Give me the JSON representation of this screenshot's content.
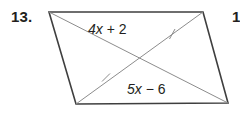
{
  "page": {
    "background_color": "#ffffff",
    "width": 240,
    "height": 126
  },
  "problem": {
    "number_label": "13.",
    "next_number_label": "1"
  },
  "figure": {
    "shape_name": "parallelogram",
    "outline_color": "#3f3f3f",
    "diagonal_color": "#8c8c8c",
    "text_color": "#231f20",
    "vertices": {
      "top_left": [
        49,
        12
      ],
      "top_right": [
        203,
        12
      ],
      "bottom_right": [
        228,
        103
      ],
      "bottom_left": [
        76,
        104
      ]
    },
    "diagonal_intersection": [
      139,
      58
    ],
    "tick_marks": [
      {
        "name": "tick-upper-right",
        "position": [
          172,
          34
        ]
      },
      {
        "name": "tick-lower-left",
        "position": [
          106,
          78
        ]
      }
    ]
  },
  "labels": {
    "top_diagonal": {
      "full_text": "4x + 2",
      "coefficient": "4",
      "variable": "x",
      "operator": "+",
      "constant": "2"
    },
    "bottom_diagonal": {
      "full_text": "5x − 6",
      "coefficient": "5",
      "variable": "x",
      "operator": "−",
      "constant": "6"
    }
  }
}
